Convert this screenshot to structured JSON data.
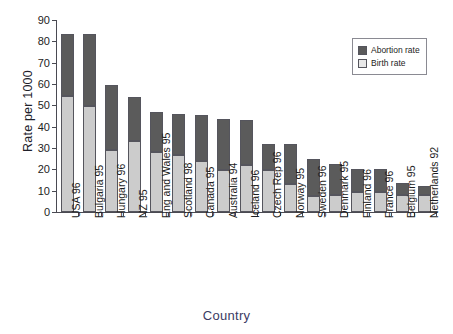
{
  "chart_data": {
    "type": "bar",
    "subtype": "stacked-vertical",
    "title": "",
    "xlabel": "Country",
    "ylabel": "Rate per 1000",
    "ylim": [
      0,
      90
    ],
    "ytick_step": 10,
    "yticks": [
      0,
      10,
      20,
      30,
      40,
      50,
      60,
      70,
      80,
      90
    ],
    "ytick_labels": [
      "0",
      "10",
      "20",
      "30",
      "40",
      "50",
      "60",
      "70",
      "80",
      "90"
    ],
    "grid": false,
    "legend_position": "top-right",
    "categories": [
      "USA 96",
      "Bulgaria 95",
      "Hungary 96",
      "NZ 95",
      "Eng and Wales 95",
      "Scotland 98",
      "Canada 95",
      "Australia 94",
      "Iceland 96",
      "Czech Rep 96",
      "Norway 95",
      "Sweden 96",
      "Denmark 95",
      "Finland 96",
      "France 96",
      "Belgium 95",
      "Netherlands 92"
    ],
    "series": [
      {
        "name": "Birth rate",
        "color": "#cccccc",
        "values": [
          54.5,
          49.5,
          29,
          33.5,
          28,
          26.5,
          24,
          19.5,
          22,
          19.5,
          13,
          7.5,
          8,
          9.5,
          9.5,
          8,
          8
        ]
      },
      {
        "name": "Abortion rate",
        "color": "#5b5b5b",
        "values": [
          29,
          34,
          30.5,
          20.5,
          19,
          19.5,
          21.5,
          24,
          21,
          12.5,
          19,
          17.5,
          14.5,
          10.5,
          10.5,
          5.5,
          4
        ]
      }
    ],
    "totals": [
      83.5,
      83.5,
      59.5,
      54,
      47,
      46,
      45.5,
      43.5,
      43,
      32,
      32,
      25,
      22.5,
      20,
      20,
      13.5,
      12
    ]
  },
  "legend": {
    "entries": [
      {
        "label": "Abortion rate",
        "swatch": "dark-gray"
      },
      {
        "label": "Birth rate",
        "swatch": "light-gray"
      }
    ]
  },
  "axes": {
    "y_title": "Rate per 1000",
    "x_title": "Country"
  }
}
